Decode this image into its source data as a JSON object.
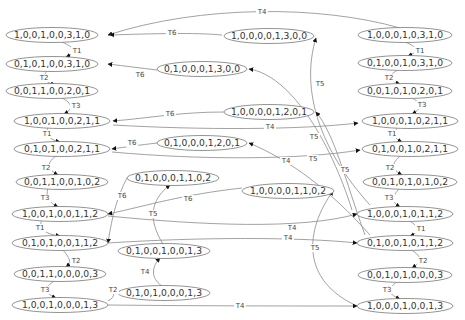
{
  "diagram": {
    "type": "state-transition-graph",
    "colors": {
      "node_stroke": "#777777",
      "edge": "#8a8a8a",
      "text": "#333333",
      "arrow": "#111111"
    },
    "nodes": [
      {
        "id": "L1",
        "label": "1,0,0,1,0,0,3,1,0",
        "x": 52,
        "y": 35,
        "rx": 46
      },
      {
        "id": "L2",
        "label": "0,1,0,1,0,0,3,1,0",
        "x": 52,
        "y": 64,
        "rx": 46
      },
      {
        "id": "L3",
        "label": "0,0,1,1,0,0,2,0,1",
        "x": 52,
        "y": 91,
        "rx": 46
      },
      {
        "id": "L4",
        "label": "1,0,0,1,0,0,2,1,1",
        "x": 62,
        "y": 121,
        "rx": 48
      },
      {
        "id": "L5",
        "label": "0,1,0,1,0,0,2,1,1",
        "x": 62,
        "y": 149,
        "rx": 48
      },
      {
        "id": "L6",
        "label": "0,0,1,1,0,0,1,0,2",
        "x": 62,
        "y": 182,
        "rx": 46
      },
      {
        "id": "L7",
        "label": "1,0,0,1,0,0,1,1,2",
        "x": 60,
        "y": 214,
        "rx": 48
      },
      {
        "id": "L8",
        "label": "0,1,0,1,0,0,1,1,2",
        "x": 60,
        "y": 243,
        "rx": 48
      },
      {
        "id": "L9",
        "label": "0,0,1,1,0,0,0,0,3",
        "x": 60,
        "y": 274,
        "rx": 46
      },
      {
        "id": "L10",
        "label": "1,0,0,1,0,0,0,1,3",
        "x": 60,
        "y": 305,
        "rx": 48
      },
      {
        "id": "M1",
        "label": "1,0,0,0,0,1,3,0,0",
        "x": 269,
        "y": 36,
        "rx": 45
      },
      {
        "id": "M2",
        "label": "0,1,0,0,0,1,3,0,0",
        "x": 202,
        "y": 69,
        "rx": 45
      },
      {
        "id": "M3",
        "label": "1,0,0,0,0,1,2,0,1",
        "x": 269,
        "y": 112,
        "rx": 45
      },
      {
        "id": "M4",
        "label": "0,1,0,0,0,1,2,0,1",
        "x": 202,
        "y": 143,
        "rx": 45
      },
      {
        "id": "M5",
        "label": "0,1,0,0,0,1,1,0,2",
        "x": 173,
        "y": 178,
        "rx": 46
      },
      {
        "id": "M6",
        "label": "1,0,0,0,0,1,1,0,2",
        "x": 288,
        "y": 191,
        "rx": 46
      },
      {
        "id": "M7",
        "label": "0,1,0,0,1,0,0,1,3",
        "x": 164,
        "y": 251,
        "rx": 46
      },
      {
        "id": "M8",
        "label": "0,1,0,1,0,0,0,1,3",
        "x": 164,
        "y": 293,
        "rx": 46
      },
      {
        "id": "R1",
        "label": "1,0,0,0,1,0,3,1,0",
        "x": 405,
        "y": 35,
        "rx": 47
      },
      {
        "id": "R2",
        "label": "0,1,0,0,1,0,3,1,0",
        "x": 405,
        "y": 63,
        "rx": 47
      },
      {
        "id": "R3",
        "label": "0,0,1,0,1,0,2,0,1",
        "x": 405,
        "y": 91,
        "rx": 47
      },
      {
        "id": "R4",
        "label": "1,0,0,0,1,0,2,1,1",
        "x": 410,
        "y": 121,
        "rx": 48
      },
      {
        "id": "R5",
        "label": "0,1,0,0,1,0,2,1,1",
        "x": 410,
        "y": 149,
        "rx": 48
      },
      {
        "id": "R6",
        "label": "0,0,1,0,1,0,1,0,2",
        "x": 410,
        "y": 182,
        "rx": 47
      },
      {
        "id": "R7",
        "label": "1,0,0,0,1,0,1,1,2",
        "x": 405,
        "y": 214,
        "rx": 48
      },
      {
        "id": "R8",
        "label": "0,1,0,0,1,0,1,1,2",
        "x": 405,
        "y": 243,
        "rx": 48
      },
      {
        "id": "R9",
        "label": "0,0,1,0,1,0,0,0,3",
        "x": 405,
        "y": 275,
        "rx": 47
      },
      {
        "id": "R10",
        "label": "1,0,0,0,1,0,0,1,3",
        "x": 405,
        "y": 306,
        "rx": 48
      }
    ],
    "edges": [
      {
        "label": "T1",
        "d": "M62,42 C75,48 78,52 66,57",
        "lx": 77,
        "ly": 51,
        "ax": 62,
        "ay": 57
      },
      {
        "label": "T2",
        "d": "M48,70 C40,78 45,82 55,85",
        "lx": 44,
        "ly": 78,
        "ax": 57,
        "ay": 85
      },
      {
        "label": "T3",
        "d": "M60,97 C75,104 72,110 64,114",
        "lx": 76,
        "ly": 106,
        "ax": 63,
        "ay": 114
      },
      {
        "label": "T1",
        "d": "M48,127 C45,135 50,140 60,142",
        "lx": 47,
        "ly": 134,
        "ax": 62,
        "ay": 142
      },
      {
        "label": "T2",
        "d": "M58,155 C45,162 48,170 58,175",
        "lx": 46,
        "ly": 168,
        "ax": 60,
        "ay": 175
      },
      {
        "label": "T3",
        "d": "M48,188 C45,198 50,203 58,207",
        "lx": 45,
        "ly": 198,
        "ax": 59,
        "ay": 207
      },
      {
        "label": "T1",
        "d": "M42,220 C38,228 44,234 60,236",
        "lx": 40,
        "ly": 228,
        "ax": 62,
        "ay": 236
      },
      {
        "label": "T2",
        "d": "M62,249 C70,258 72,262 66,267",
        "lx": 76,
        "ly": 261,
        "ax": 65,
        "ay": 267
      },
      {
        "label": "T3",
        "d": "M56,280 C42,288 46,294 56,298",
        "lx": 45,
        "ly": 290,
        "ax": 57,
        "ay": 298
      },
      {
        "label": "T1",
        "d": "M405,42 C420,48 418,52 408,56",
        "lx": 420,
        "ly": 51,
        "ax": 405,
        "ay": 56
      },
      {
        "label": "T2",
        "d": "M400,69 C385,76 390,81 400,84",
        "lx": 389,
        "ly": 78,
        "ax": 402,
        "ay": 84
      },
      {
        "label": "T3",
        "d": "M410,97 C425,104 420,110 412,114",
        "lx": 422,
        "ly": 105,
        "ax": 410,
        "ay": 114
      },
      {
        "label": "T1",
        "d": "M398,127 C392,135 395,139 402,142",
        "lx": 392,
        "ly": 134,
        "ax": 404,
        "ay": 142
      },
      {
        "label": "T2",
        "d": "M402,155 C390,163 392,170 402,175",
        "lx": 390,
        "ly": 168,
        "ax": 404,
        "ay": 175
      },
      {
        "label": "T3",
        "d": "M400,188 C390,198 393,203 400,207",
        "lx": 389,
        "ly": 198,
        "ax": 402,
        "ay": 207
      },
      {
        "label": "T1",
        "d": "M408,220 C422,228 418,233 410,236",
        "lx": 421,
        "ly": 229,
        "ax": 408,
        "ay": 236
      },
      {
        "label": "T2",
        "d": "M410,249 C425,258 420,263 412,268",
        "lx": 423,
        "ly": 261,
        "ax": 410,
        "ay": 268
      },
      {
        "label": "T3",
        "d": "M398,281 C385,290 390,295 400,299",
        "lx": 387,
        "ly": 290,
        "ax": 402,
        "ay": 299
      },
      {
        "label": "T4",
        "d": "M400,28 C320,5 200,5 108,35",
        "lx": 262,
        "ly": 12,
        "ax": 105,
        "ay": 35
      },
      {
        "label": "T6",
        "d": "M222,35 C200,33 170,33 110,35",
        "lx": 172,
        "ly": 33,
        "ax": 107,
        "ay": 35
      },
      {
        "label": "T6",
        "d": "M157,70 C140,68 125,66 108,64",
        "lx": 140,
        "ly": 75,
        "ax": 105,
        "ay": 64
      },
      {
        "label": "T5",
        "d": "M370,205 C320,150 300,90 316,38",
        "lx": 320,
        "ly": 84,
        "ax": 316,
        "ay": 38
      },
      {
        "label": "T5",
        "d": "M352,210 C330,140 290,75 249,69",
        "lx": 314,
        "ly": 137,
        "ax": 249,
        "ay": 69
      },
      {
        "label": "T6",
        "d": "M224,112 C180,112 150,118 113,121",
        "lx": 170,
        "ly": 114,
        "ax": 111,
        "ay": 121
      },
      {
        "label": "T4",
        "d": "M113,125 C200,130 300,130 358,123",
        "lx": 270,
        "ly": 127,
        "ax": 360,
        "ay": 122
      },
      {
        "label": "T5",
        "d": "M365,235 C345,180 335,135 316,112",
        "lx": 345,
        "ly": 170,
        "ax": 316,
        "ay": 112
      },
      {
        "label": "T6",
        "d": "M157,143 C140,145 125,147 112,149",
        "lx": 132,
        "ly": 143,
        "ax": 110,
        "ay": 149
      },
      {
        "label": "T5",
        "d": "M370,235 C330,190 290,160 249,143",
        "lx": 313,
        "ly": 159,
        "ax": 249,
        "ay": 143
      },
      {
        "label": "T4",
        "d": "M112,152 C200,160 300,160 360,150",
        "lx": 286,
        "ly": 161,
        "ax": 362,
        "ay": 149
      },
      {
        "label": "T6",
        "d": "M127,178 C118,195 112,215 108,243",
        "lx": 122,
        "ly": 196,
        "ax": 107,
        "ay": 243
      },
      {
        "label": "T6",
        "d": "M242,188 C180,195 150,205 108,214",
        "lx": 188,
        "ly": 199,
        "ax": 106,
        "ay": 214
      },
      {
        "label": "T5",
        "d": "M163,244 C148,220 150,200 170,185",
        "lx": 153,
        "ly": 214,
        "ax": 172,
        "ay": 184
      },
      {
        "label": "T4",
        "d": "M108,216 C200,225 300,230 357,214",
        "lx": 292,
        "ly": 228,
        "ax": 359,
        "ay": 214
      },
      {
        "label": "T4",
        "d": "M108,243 C200,237 300,237 357,243",
        "lx": 288,
        "ly": 238,
        "ax": 359,
        "ay": 243
      },
      {
        "label": "T5",
        "d": "M357,306 C300,280 305,230 333,191",
        "lx": 315,
        "ly": 248,
        "ax": 334,
        "ay": 190
      },
      {
        "label": "T4",
        "d": "M162,286 C150,278 152,266 160,258",
        "lx": 145,
        "ly": 272,
        "ax": 161,
        "ay": 257
      },
      {
        "label": "T2",
        "d": "M108,301 C118,296 110,290 118,293",
        "lx": 113,
        "ly": 290,
        "ax": 118,
        "ay": 293
      },
      {
        "label": "T4",
        "d": "M108,305 C200,306 300,306 357,306",
        "lx": 240,
        "ly": 306,
        "ax": 357,
        "ay": 306
      }
    ]
  }
}
